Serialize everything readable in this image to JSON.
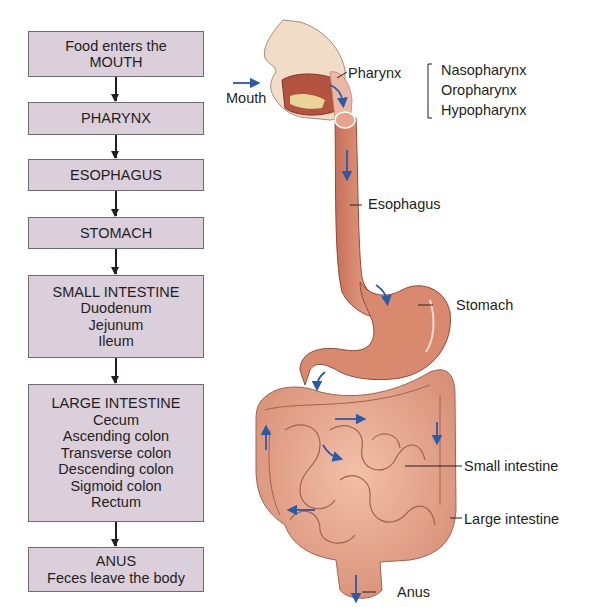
{
  "flowchart": {
    "boxes": [
      {
        "lines": [
          "Food enters the",
          "MOUTH"
        ]
      },
      {
        "lines": [
          "PHARYNX"
        ]
      },
      {
        "lines": [
          "ESOPHAGUS"
        ]
      },
      {
        "lines": [
          "STOMACH"
        ]
      },
      {
        "lines": [
          "SMALL INTESTINE",
          "Duodenum",
          "Jejunum",
          "Ileum"
        ]
      },
      {
        "lines": [
          "LARGE INTESTINE",
          "Cecum",
          "Ascending colon",
          "Transverse colon",
          "Descending colon",
          "Sigmoid colon",
          "Rectum"
        ]
      },
      {
        "lines": [
          "ANUS",
          "Feces leave the body"
        ]
      }
    ],
    "box_fill": "#dccfdc",
    "box_border": "#6e6a6e"
  },
  "illustration": {
    "labels": {
      "mouth": "Mouth",
      "pharynx": "Pharynx",
      "pharynx_parts": [
        "Nasopharynx",
        "Oropharynx",
        "Hypopharynx"
      ],
      "esophagus": "Esophagus",
      "stomach": "Stomach",
      "small_intestine": "Small intestine",
      "large_intestine": "Large intestine",
      "anus": "Anus"
    },
    "flow_arrow_color": "#2a5aa8",
    "tissue_color": "#d98a6e"
  }
}
